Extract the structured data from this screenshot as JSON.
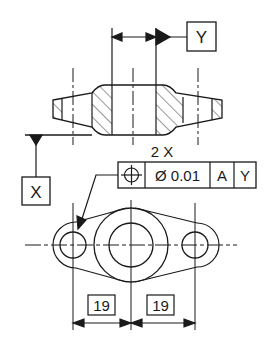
{
  "drawing": {
    "type": "GD&T position tolerance example",
    "section_view": {
      "datum_feature_label": "Y",
      "datum_base_label": "X"
    },
    "feature_control_frame": {
      "count_label": "2 X",
      "symbol": "position-icon",
      "tolerance": "Ø 0.01",
      "datum_primary": "A",
      "datum_secondary": "Y"
    },
    "dimensions": {
      "left_basic": "19",
      "right_basic": "19"
    },
    "colors": {
      "line": "#1a1a1a",
      "background": "#ffffff"
    }
  }
}
